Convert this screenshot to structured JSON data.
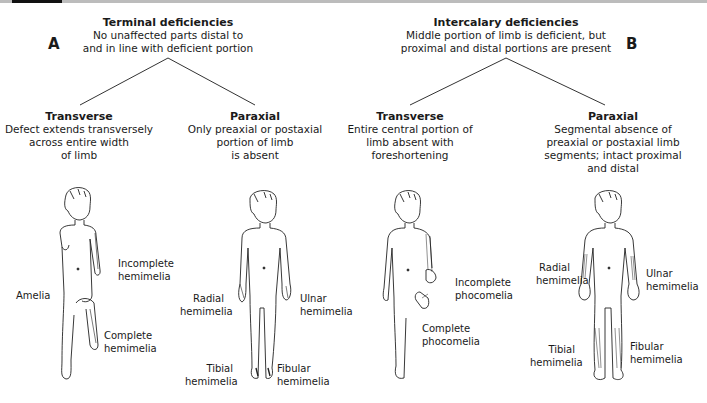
{
  "panels": [
    {
      "letter": "A",
      "heading": {
        "title": "Terminal deficiencies",
        "line1": "No unaffected parts distal to",
        "line2": "and in line with deficient portion"
      },
      "branches": [
        {
          "title": "Transverse",
          "lines": [
            "Defect extends transversely",
            "across entire width",
            "of limb"
          ],
          "labels": [
            "Amelia",
            "Incomplete",
            "hemimelia",
            "Complete",
            "hemimelia"
          ]
        },
        {
          "title": "Paraxial",
          "lines": [
            "Only preaxial or postaxial",
            "portion of limb",
            "is absent"
          ],
          "labels": [
            "Radial",
            "hemimelia",
            "Ulnar",
            "hemimelia",
            "Tibial",
            "hemimelia",
            "Fibular",
            "hemimelia"
          ]
        }
      ]
    },
    {
      "letter": "B",
      "heading": {
        "title": "Intercalary deficiencies",
        "line1": "Middle portion of limb is deficient, but",
        "line2": "proximal and distal portions are present"
      },
      "branches": [
        {
          "title": "Transverse",
          "lines": [
            "Entire central portion of",
            "limb absent with",
            "foreshortening"
          ],
          "labels": [
            "Incomplete",
            "phocomelia",
            "Complete",
            "phocomelia"
          ]
        },
        {
          "title": "Paraxial",
          "lines": [
            "Segmental absence of",
            "preaxial or postaxial limb",
            "segments; intact proximal",
            "and distal"
          ],
          "labels": [
            "Radial",
            "hemimelia",
            "Ulnar",
            "hemimelia",
            "Tibial",
            "hemimelia",
            "Fibular",
            "hemimelia"
          ]
        }
      ]
    }
  ],
  "colors": {
    "ink": "#1a1a1a",
    "rule": "#bcbcbc"
  }
}
